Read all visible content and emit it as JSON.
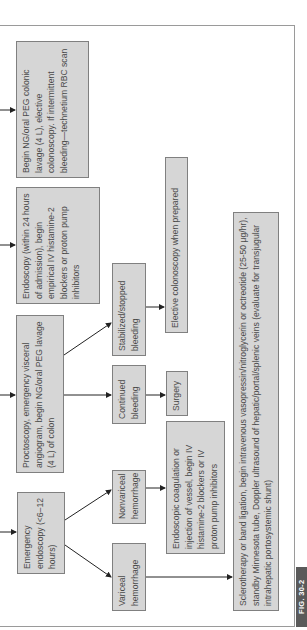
{
  "figure_label": "FIG. 30-2",
  "orientation": "rotated 90° counter-clockwise (text reads bottom-to-top)",
  "colors": {
    "box_fill": "#d6d6d6",
    "box_border": "#808080",
    "text": "#4a4a4a",
    "arrow": "#222222",
    "label_bg": "#5a5a5a"
  },
  "nodes": {
    "emergency_endoscopy": "Emergency endoscopy (<6–12 hours)",
    "proctoscopy": "Proctoscopy, emergency visceral angiogram, begin NG/oral PEG lavage (4 L) of colon",
    "endoscopy_24h": "Endoscopy (within 24 hours of admission), begin empirical IV histamine-2 blockers or proton pump inhibitors",
    "ng_lavage": "Begin NG/oral PEG colonic lavage (4 L), elective colonoscopy. If intermittent bleeding—technetium RBC scan",
    "variceal": "Variceal hemorrhage",
    "nonvariceal": "Nonvariceal hemorrhage",
    "continued_bleeding": "Continued bleeding",
    "stabilized": "Stabilized/stopped bleeding",
    "sclerotherapy": "Sclerotherapy or band ligation, begin intravenous vasopressin/nitroglycerin or octreotide (25-50 μg/hr), standby Minnesota tube, Doppler ultrasound of hepatic/portal/splenic veins (evaluate for transjugular intrahepatic portosystemic shunt)",
    "endoscopic_coagulation": "Endoscopic coagulation or injection of vessel, begin IV histamine-2 blockers or IV proton pump inhibitors",
    "surgery": "Surgery",
    "elective_colonoscopy": "Elective colonoscopy when prepared"
  },
  "edges": [
    [
      "entry",
      "emergency_endoscopy"
    ],
    [
      "entry",
      "proctoscopy"
    ],
    [
      "entry",
      "endoscopy_24h"
    ],
    [
      "entry",
      "ng_lavage"
    ],
    [
      "emergency_endoscopy",
      "variceal"
    ],
    [
      "emergency_endoscopy",
      "nonvariceal"
    ],
    [
      "proctoscopy",
      "continued_bleeding"
    ],
    [
      "proctoscopy",
      "stabilized"
    ],
    [
      "variceal",
      "sclerotherapy"
    ],
    [
      "nonvariceal",
      "endoscopic_coagulation"
    ],
    [
      "continued_bleeding",
      "surgery"
    ],
    [
      "stabilized",
      "elective_colonoscopy"
    ]
  ]
}
